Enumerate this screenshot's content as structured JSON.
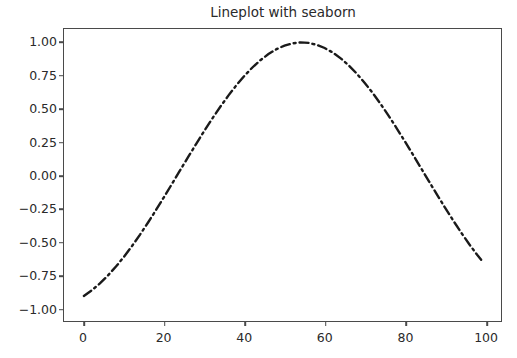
{
  "figure": {
    "background_color": "#ffffff",
    "width": 517,
    "height": 358
  },
  "chart_data": {
    "type": "line",
    "title": "Lineplot with seaborn",
    "xlabel": "",
    "ylabel": "",
    "xlim": [
      -4.95,
      103.95
    ],
    "ylim": [
      -1.1,
      1.1
    ],
    "grid": false,
    "legend": null,
    "line_style": "dash-dot",
    "line_color": "#1a1a1a",
    "line_width": 2.0,
    "xticks": [
      0,
      20,
      40,
      60,
      80,
      100
    ],
    "xtick_labels": [
      "0",
      "20",
      "40",
      "60",
      "80",
      "100"
    ],
    "yticks": [
      1.0,
      0.75,
      0.5,
      0.25,
      0.0,
      -0.25,
      -0.5,
      -0.75,
      -1.0
    ],
    "ytick_labels": [
      "1.00",
      "0.75",
      "0.50",
      "0.25",
      "0.00",
      "−0.25",
      "−0.50",
      "−0.75",
      "−1.00"
    ],
    "x": [
      0,
      2,
      4,
      6,
      8,
      10,
      12,
      14,
      16,
      18,
      20,
      22,
      24,
      26,
      28,
      30,
      32,
      34,
      36,
      38,
      40,
      42,
      44,
      46,
      48,
      50,
      52,
      54,
      56,
      58,
      60,
      62,
      64,
      66,
      68,
      70,
      72,
      74,
      76,
      78,
      80,
      82,
      84,
      86,
      88,
      90,
      92,
      94,
      96,
      98,
      99
    ],
    "values": [
      -0.911,
      -0.868,
      -0.817,
      -0.757,
      -0.69,
      -0.616,
      -0.535,
      -0.449,
      -0.358,
      -0.263,
      -0.165,
      -0.065,
      0.036,
      0.136,
      0.235,
      0.332,
      0.425,
      0.514,
      0.598,
      0.676,
      0.747,
      0.81,
      0.865,
      0.911,
      0.948,
      0.975,
      0.992,
      0.999,
      0.995,
      0.981,
      0.957,
      0.923,
      0.879,
      0.826,
      0.764,
      0.694,
      0.617,
      0.533,
      0.444,
      0.35,
      0.253,
      0.154,
      0.053,
      -0.048,
      -0.148,
      -0.246,
      -0.341,
      -0.433,
      -0.52,
      -0.601,
      -0.639
    ],
    "series_name": "sine wave"
  },
  "axes": {
    "spine_color": "#4a4a4a",
    "tick_color": "#4a4a4a",
    "label_color": "#2a2a2a"
  }
}
